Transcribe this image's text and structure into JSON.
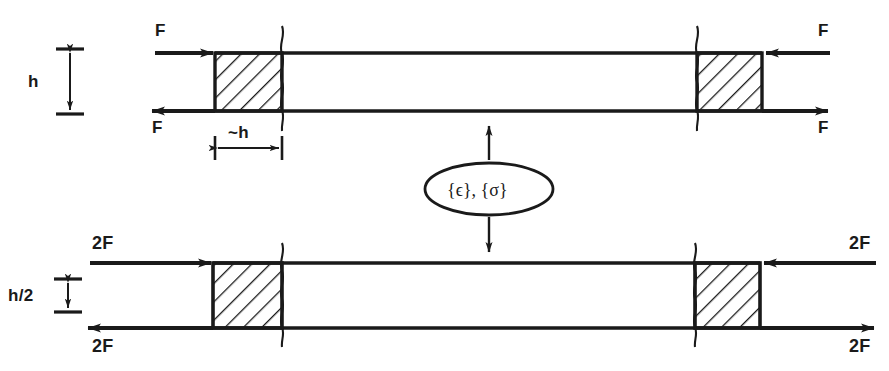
{
  "figure": {
    "ink_color": "#1a1a1a",
    "background_color": "#ffffff"
  },
  "top_specimen": {
    "name": "full-height-specimen",
    "height_label": "h",
    "grip_width_label": "~h",
    "force_top_left": "F",
    "force_bottom_left": "F",
    "force_top_right": "F",
    "force_bottom_right": "F"
  },
  "bottom_specimen": {
    "name": "half-height-specimen",
    "height_label": "h/2",
    "force_top_left": "2F",
    "force_bottom_left": "2F",
    "force_top_right": "2F",
    "force_bottom_right": "2F"
  },
  "equivalence_node": {
    "name": "strain-stress-state",
    "label": "{ϵ}, {σ}",
    "strain_symbol": "{ϵ}",
    "stress_symbol": "{σ}"
  }
}
